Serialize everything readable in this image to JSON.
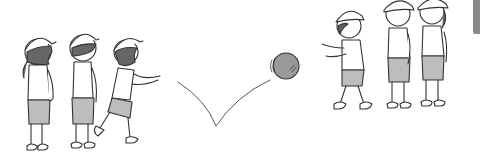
{
  "scene": {
    "description": "Line illustration of children in helmets playing catch with a bouncing ball",
    "left_group_count": 3,
    "right_group_count": 3,
    "ball": "gray ball with bounce trajectory",
    "colors": {
      "line": "#333333",
      "helmet": "#ffffff",
      "shorts": "#bdbdbd",
      "hair": "#666666",
      "ball": "#9a9a9a",
      "skin": "#ffffff",
      "edge_tab": "#8a8a8a"
    }
  }
}
